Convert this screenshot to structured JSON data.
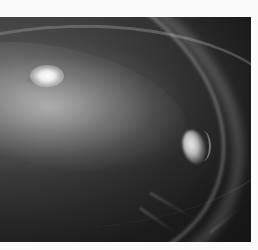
{
  "image": {
    "subject": "Protoplanetary disk around a bright star with a planet carving a gap",
    "palette": "grayscale",
    "background_color": "#fbfbfb",
    "frame_color": "#1d1d1d",
    "features": [
      {
        "name": "central-star",
        "description": "bright star with two faint lobes, upper left"
      },
      {
        "name": "inner-disk",
        "description": "diffuse glowing disk around star"
      },
      {
        "name": "main-ring",
        "description": "bright curved ring arcing from left to lower right"
      },
      {
        "name": "outer-ring",
        "description": "faint outer ring near top edge"
      },
      {
        "name": "planet",
        "description": "bright clump embedded in ring, right side"
      }
    ]
  }
}
